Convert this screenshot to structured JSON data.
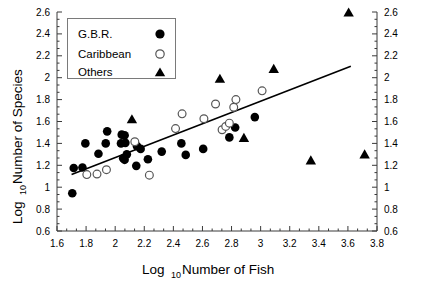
{
  "chart_data": {
    "type": "scatter",
    "title": "",
    "xlabel": "Log10 Number of Fish",
    "ylabel": "Log10 Number of Species",
    "xlabel_base": "Log",
    "xlabel_sub": "10",
    "xlabel_rest": "Number of Fish",
    "ylabel_base": "Log",
    "ylabel_sub": "10",
    "ylabel_rest": "Number of Species",
    "xlim": [
      1.6,
      3.8
    ],
    "ylim": [
      0.6,
      2.6
    ],
    "xticks": [
      1.6,
      1.8,
      2.0,
      2.2,
      2.4,
      2.6,
      2.8,
      3.0,
      3.2,
      3.4,
      3.6,
      3.8
    ],
    "xtick_labels": [
      "1.6",
      "1.8",
      "2",
      "2.2",
      "2.4",
      "2.6",
      "2.8",
      "3",
      "3.2",
      "3.4",
      "3.6",
      "3.8"
    ],
    "yticks": [
      0.6,
      0.8,
      1.0,
      1.2,
      1.4,
      1.6,
      1.8,
      2.0,
      2.2,
      2.4,
      2.6
    ],
    "ytick_labels": [
      "0.6",
      "0.8",
      "1",
      "1.2",
      "1.4",
      "1.6",
      "1.8",
      "2",
      "2.2",
      "2.4",
      "2.6"
    ],
    "grid": false,
    "minor_ticks_per_interval": 2,
    "right_axis": true,
    "legend": {
      "position": "top-left-inside",
      "entries": [
        {
          "name": "G.B.R.",
          "marker": "filled-circle"
        },
        {
          "name": "Caribbean",
          "marker": "open-circle"
        },
        {
          "name": "Others",
          "marker": "filled-triangle"
        }
      ]
    },
    "trendline": {
      "x": [
        1.7,
        3.62
      ],
      "y": [
        1.115,
        2.105
      ]
    },
    "series": [
      {
        "name": "G.B.R.",
        "marker": "filled-circle",
        "points": [
          [
            1.705,
            0.945
          ],
          [
            1.715,
            1.175
          ],
          [
            1.775,
            1.18
          ],
          [
            1.795,
            1.4
          ],
          [
            1.885,
            1.305
          ],
          [
            1.935,
            1.4
          ],
          [
            1.945,
            1.51
          ],
          [
            2.04,
            1.4
          ],
          [
            2.045,
            1.48
          ],
          [
            2.055,
            1.265
          ],
          [
            2.065,
            1.25
          ],
          [
            2.065,
            1.475
          ],
          [
            2.07,
            1.405
          ],
          [
            2.08,
            1.3
          ],
          [
            2.145,
            1.195
          ],
          [
            2.15,
            1.375
          ],
          [
            2.175,
            1.35
          ],
          [
            2.225,
            1.255
          ],
          [
            2.32,
            1.325
          ],
          [
            2.455,
            1.4
          ],
          [
            2.485,
            1.295
          ],
          [
            2.605,
            1.35
          ],
          [
            2.785,
            1.455
          ],
          [
            2.825,
            1.545
          ],
          [
            2.96,
            1.64
          ]
        ]
      },
      {
        "name": "Caribbean",
        "marker": "open-circle",
        "points": [
          [
            1.805,
            1.115
          ],
          [
            1.875,
            1.12
          ],
          [
            1.94,
            1.16
          ],
          [
            2.135,
            1.415
          ],
          [
            2.235,
            1.11
          ],
          [
            2.415,
            1.535
          ],
          [
            2.46,
            1.67
          ],
          [
            2.61,
            1.625
          ],
          [
            2.69,
            1.76
          ],
          [
            2.735,
            1.525
          ],
          [
            2.76,
            1.555
          ],
          [
            2.785,
            1.585
          ],
          [
            2.815,
            1.73
          ],
          [
            2.83,
            1.8
          ],
          [
            3.01,
            1.88
          ]
        ]
      },
      {
        "name": "Others",
        "marker": "filled-triangle",
        "points": [
          [
            2.115,
            1.625
          ],
          [
            2.72,
            1.995
          ],
          [
            2.885,
            1.455
          ],
          [
            3.09,
            2.085
          ],
          [
            3.345,
            1.25
          ],
          [
            3.605,
            2.6
          ],
          [
            3.715,
            1.305
          ]
        ]
      }
    ]
  },
  "figure": {
    "background": "#ffffff",
    "marker_color": "#000000",
    "open_marker_stroke": "#555555",
    "axis_color": "#3a3a3a",
    "line_color": "#000000",
    "legend_border": "#7a7a7a"
  }
}
